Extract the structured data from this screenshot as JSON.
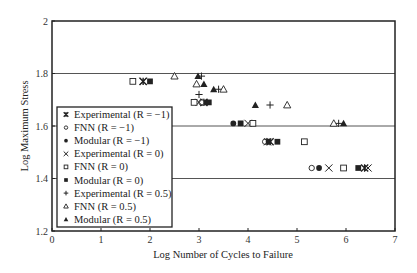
{
  "chart_data": {
    "type": "scatter",
    "title": "",
    "xlabel": "Log Number of Cycles to Failure",
    "ylabel": "Log Maximum Stress",
    "xlim": [
      0,
      7
    ],
    "ylim": [
      1.2,
      2
    ],
    "xticks": [
      "0",
      "1",
      "2",
      "3",
      "4",
      "5",
      "6",
      "7"
    ],
    "yticks": [
      "1.2",
      "1.4",
      "1.6",
      "1.8",
      "2"
    ],
    "grid": "horizontal at 1.4, 1.6, 1.8",
    "legend_position": "lower left inside",
    "series": [
      {
        "name": "Experimental (R = −1)",
        "marker": "asterisk",
        "points": [
          [
            1.86,
            1.77
          ],
          [
            3.1,
            1.69
          ],
          [
            4.45,
            1.54
          ],
          [
            6.38,
            1.44
          ]
        ]
      },
      {
        "name": "FNN (R = −1)",
        "marker": "open-circle",
        "points": [
          [
            3.05,
            1.69
          ],
          [
            4.35,
            1.54
          ],
          [
            5.3,
            1.44
          ]
        ]
      },
      {
        "name": "Modular (R = −1)",
        "marker": "filled-circle",
        "points": [
          [
            3.15,
            1.69
          ],
          [
            3.7,
            1.61
          ],
          [
            4.42,
            1.54
          ],
          [
            5.45,
            1.44
          ]
        ]
      },
      {
        "name": "Experimental (R = 0)",
        "marker": "x",
        "points": [
          [
            1.86,
            1.77
          ],
          [
            3.0,
            1.69
          ],
          [
            4.0,
            1.61
          ],
          [
            4.4,
            1.54
          ],
          [
            5.65,
            1.44
          ],
          [
            6.45,
            1.44
          ]
        ]
      },
      {
        "name": "FNN (R = 0)",
        "marker": "open-square",
        "points": [
          [
            1.65,
            1.77
          ],
          [
            2.9,
            1.69
          ],
          [
            4.1,
            1.61
          ],
          [
            5.15,
            1.54
          ],
          [
            5.95,
            1.44
          ]
        ]
      },
      {
        "name": "Modular (R = 0)",
        "marker": "filled-square",
        "points": [
          [
            2.0,
            1.77
          ],
          [
            3.2,
            1.69
          ],
          [
            3.85,
            1.61
          ],
          [
            4.6,
            1.54
          ],
          [
            6.25,
            1.44
          ]
        ]
      },
      {
        "name": "Experimental (R = 0.5)",
        "marker": "plus",
        "points": [
          [
            3.05,
            1.79
          ],
          [
            3.4,
            1.74
          ],
          [
            3.0,
            1.72
          ],
          [
            4.45,
            1.68
          ],
          [
            5.85,
            1.61
          ]
        ]
      },
      {
        "name": "FNN (R = 0.5)",
        "marker": "open-triangle",
        "points": [
          [
            2.5,
            1.79
          ],
          [
            2.95,
            1.76
          ],
          [
            3.5,
            1.74
          ],
          [
            4.8,
            1.68
          ],
          [
            5.75,
            1.61
          ]
        ]
      },
      {
        "name": "Modular (R = 0.5)",
        "marker": "filled-triangle",
        "points": [
          [
            2.98,
            1.79
          ],
          [
            3.1,
            1.76
          ],
          [
            3.3,
            1.74
          ],
          [
            4.15,
            1.68
          ],
          [
            5.95,
            1.61
          ]
        ]
      }
    ]
  },
  "legend": {
    "items": [
      {
        "label": "Experimental (R = −1)",
        "marker": "asterisk"
      },
      {
        "label": "FNN (R = −1)",
        "marker": "open-circle"
      },
      {
        "label": "Modular (R = −1)",
        "marker": "filled-circle"
      },
      {
        "label": "Experimental (R = 0)",
        "marker": "x"
      },
      {
        "label": "FNN (R = 0)",
        "marker": "open-square"
      },
      {
        "label": "Modular (R = 0)",
        "marker": "filled-square"
      },
      {
        "label": "Experimental (R = 0.5)",
        "marker": "plus"
      },
      {
        "label": "FNN (R = 0.5)",
        "marker": "open-triangle"
      },
      {
        "label": "Modular (R = 0.5)",
        "marker": "filled-triangle"
      }
    ]
  },
  "colors": {
    "ink": "#222222",
    "gridline": "#555555",
    "background": "#ffffff"
  }
}
